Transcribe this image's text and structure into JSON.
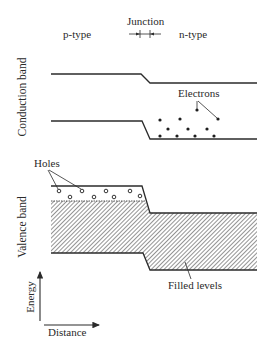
{
  "diagram": {
    "region_labels": {
      "p_type": "p-type",
      "junction": "Junction",
      "n_type": "n-type"
    },
    "axis_side_labels": {
      "conduction_band": "Conduction band",
      "valence_band": "Valence band"
    },
    "annotations": {
      "electrons": "Electrons",
      "holes": "Holes",
      "filled_levels": "Filled levels"
    },
    "axes": {
      "y_label": "Energy",
      "x_label": "Distance"
    },
    "colors": {
      "line": "#2b2b2b",
      "hatch": "#3a3a3a",
      "background": "#ffffff"
    },
    "electron_count": 11,
    "hole_count": 8
  }
}
